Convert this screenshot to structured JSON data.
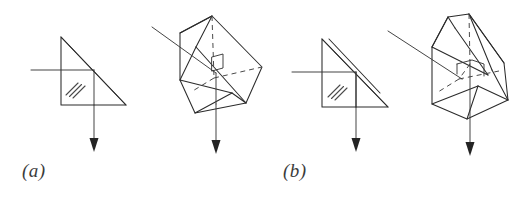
{
  "figure": {
    "background_color": "#ffffff",
    "line_color": "#2b2b2b",
    "hidden_line_color": "#4a4a4a",
    "caption_color": "#3b3b3b",
    "width": 531,
    "height": 199,
    "panels": [
      {
        "id": "a",
        "caption": "(a)",
        "caption_x": 22,
        "caption_y": 177,
        "prism_name": "right-angle-prism",
        "views": [
          "cross-section",
          "perspective"
        ],
        "ray_in_direction": "horizontal-left-to-right",
        "ray_out_direction": "vertical-downward",
        "hatch_marks": 3,
        "roof_edge": false
      },
      {
        "id": "b",
        "caption": "(b)",
        "caption_x": 283,
        "caption_y": 177,
        "prism_name": "amici-roof-prism",
        "views": [
          "cross-section",
          "perspective"
        ],
        "ray_in_direction": "horizontal-left-to-right",
        "ray_out_direction": "vertical-downward",
        "hatch_marks": 3,
        "roof_edge": true
      }
    ]
  }
}
